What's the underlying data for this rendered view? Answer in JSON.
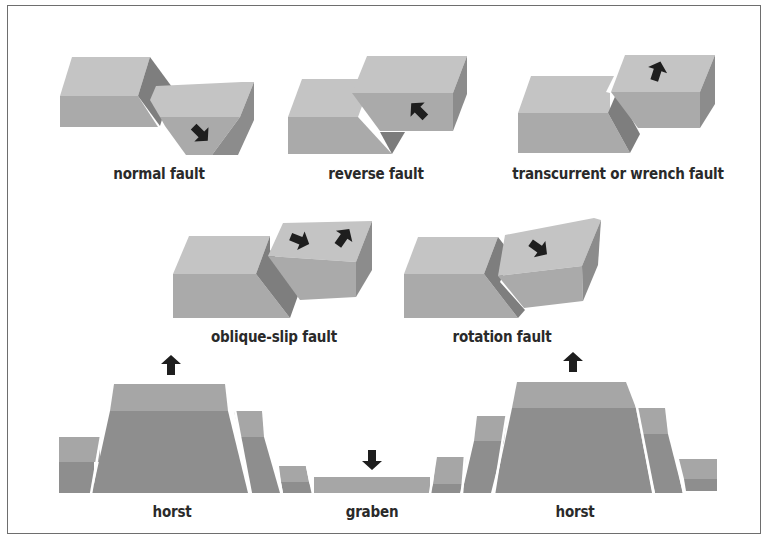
{
  "colors": {
    "top_face": "#c4c4c4",
    "front_face": "#aaaaaa",
    "side_face": "#8c8c8c",
    "fault_face": "#7c7c7c",
    "arrow": "#1e1e1e",
    "frame": "#6e6e6e",
    "layer_top": "#a6a6a6",
    "layer_bottom": "#8e8e8e"
  },
  "faults": [
    {
      "id": "normal",
      "label": "normal fault",
      "arrow_direction": "down-right"
    },
    {
      "id": "reverse",
      "label": "reverse fault",
      "arrow_direction": "up-left"
    },
    {
      "id": "transcurrent",
      "label": "transcurrent or wrench fault",
      "arrow_direction": "up"
    },
    {
      "id": "oblique-slip",
      "label": "oblique-slip fault",
      "arrow_direction": "right and up-right"
    },
    {
      "id": "rotation",
      "label": "rotation fault",
      "arrow_direction": "down-right"
    }
  ],
  "cross_section": {
    "labels": [
      "horst",
      "graben",
      "horst"
    ],
    "arrows": [
      {
        "feature": "horst-left",
        "direction": "up"
      },
      {
        "feature": "graben",
        "direction": "down"
      },
      {
        "feature": "horst-right",
        "direction": "up"
      }
    ]
  }
}
